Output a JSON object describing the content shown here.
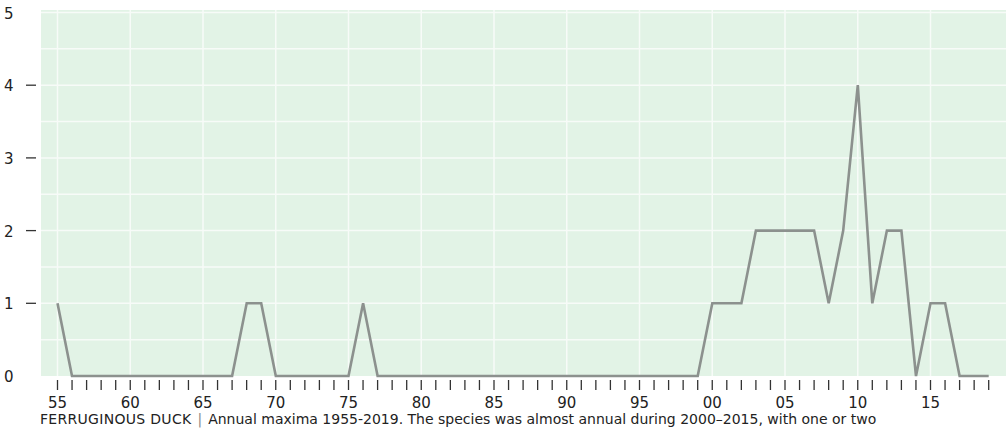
{
  "chart_data": {
    "type": "line",
    "title": "FERRUGINOUS DUCK",
    "caption": "Annual maxima 1955-2019. The species was almost annual during 2000–2015, with one or two",
    "xlabel": "",
    "ylabel": "",
    "ylim": [
      0,
      5
    ],
    "yticks": [
      0,
      1,
      2,
      3,
      4,
      5
    ],
    "xtick_labels": [
      "55",
      "60",
      "65",
      "70",
      "75",
      "80",
      "85",
      "90",
      "95",
      "00",
      "05",
      "10",
      "15"
    ],
    "grid": true,
    "x": [
      1955,
      1956,
      1957,
      1958,
      1959,
      1960,
      1961,
      1962,
      1963,
      1964,
      1965,
      1966,
      1967,
      1968,
      1969,
      1970,
      1971,
      1972,
      1973,
      1974,
      1975,
      1976,
      1977,
      1978,
      1979,
      1980,
      1981,
      1982,
      1983,
      1984,
      1985,
      1986,
      1987,
      1988,
      1989,
      1990,
      1991,
      1992,
      1993,
      1994,
      1995,
      1996,
      1997,
      1998,
      1999,
      2000,
      2001,
      2002,
      2003,
      2004,
      2005,
      2006,
      2007,
      2008,
      2009,
      2010,
      2011,
      2012,
      2013,
      2014,
      2015,
      2016,
      2017,
      2018,
      2019
    ],
    "series": [
      {
        "name": "Annual maximum",
        "values": [
          1,
          0,
          0,
          0,
          0,
          0,
          0,
          0,
          0,
          0,
          0,
          0,
          0,
          1,
          1,
          0,
          0,
          0,
          0,
          0,
          0,
          1,
          0,
          0,
          0,
          0,
          0,
          0,
          0,
          0,
          0,
          0,
          0,
          0,
          0,
          0,
          0,
          0,
          0,
          0,
          0,
          0,
          0,
          0,
          0,
          1,
          1,
          1,
          2,
          2,
          2,
          2,
          2,
          1,
          2,
          4,
          1,
          2,
          2,
          0,
          1,
          1,
          0,
          0,
          0
        ]
      }
    ]
  },
  "colors": {
    "plot_background": "#e2f3e6",
    "gridline": "#f7fbf8",
    "line": "#8c918e",
    "text": "#222222"
  },
  "caption": {
    "species": "FERRUGINOUS DUCK",
    "separator": "|",
    "text": "Annual maxima 1955-2019. The species was almost annual during 2000–2015, with one or two"
  }
}
